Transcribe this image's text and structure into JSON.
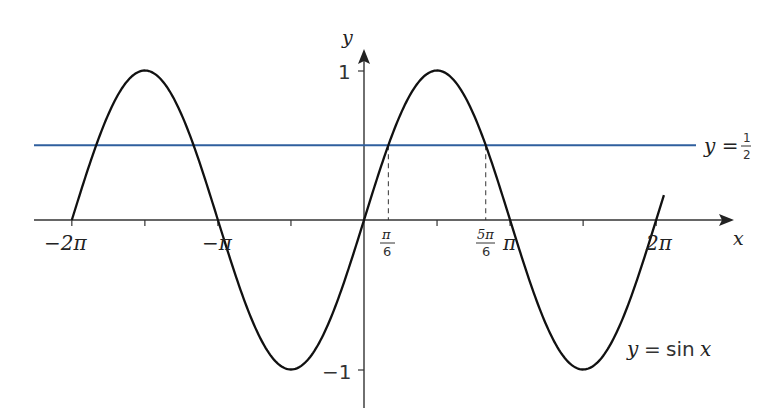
{
  "chart_data": {
    "type": "line",
    "title": "",
    "xlabel": "x",
    "ylabel": "y",
    "xlim": [
      -6.5,
      7.9
    ],
    "ylim": [
      -1.3,
      1.25
    ],
    "grid": false,
    "legend": "none",
    "series": [
      {
        "name": "y = sin x",
        "function": "sin(x)",
        "domain": [
          -6.2832,
          6.45
        ],
        "color": "#111111",
        "label_text": "y = sin x"
      },
      {
        "name": "y = 1/2",
        "function": "0.5",
        "domain": [
          -7.8,
          8.45
        ],
        "color": "#2f5f9e",
        "label_text": "y = 1/2"
      }
    ],
    "x_ticks": [
      {
        "value": -6.2832,
        "label": "−2π"
      },
      {
        "value": -4.7124,
        "label": ""
      },
      {
        "value": -3.1416,
        "label": "−π"
      },
      {
        "value": -1.5708,
        "label": ""
      },
      {
        "value": 0.5236,
        "label": "π/6"
      },
      {
        "value": 1.5708,
        "label": ""
      },
      {
        "value": 2.618,
        "label": "5π/6"
      },
      {
        "value": 3.1416,
        "label": "π"
      },
      {
        "value": 4.7124,
        "label": ""
      },
      {
        "value": 6.2832,
        "label": "2π"
      }
    ],
    "y_ticks": [
      {
        "value": 1,
        "label": "1"
      },
      {
        "value": -1,
        "label": "−1"
      }
    ],
    "annotations": [
      {
        "type": "dashed-vline",
        "x": 0.5236,
        "from_y": 0,
        "to_y": 0.5
      },
      {
        "type": "dashed-vline",
        "x": 2.618,
        "from_y": 0,
        "to_y": 0.5
      }
    ],
    "intersections": [
      {
        "x": -5.7596,
        "y": 0.5
      },
      {
        "x": -3.6652,
        "y": 0.5
      },
      {
        "x": 0.5236,
        "y": 0.5
      },
      {
        "x": 2.618,
        "y": 0.5
      }
    ]
  },
  "labels": {
    "x_axis": "x",
    "y_axis": "y",
    "y_one": "1",
    "y_minus_one": "−1",
    "neg_two_pi": "−2π",
    "neg_pi": "−π",
    "pi_over_6_num": "π",
    "pi_over_6_den": "6",
    "five_pi_over_6_num": "5π",
    "five_pi_over_6_den": "6",
    "pi": "π",
    "two_pi": "2π",
    "half_line_prefix": "y =",
    "half_num": "1",
    "half_den": "2",
    "sin_label_y": "y",
    "sin_label_eq": "=",
    "sin_label_fn": "sin",
    "sin_label_x": "x"
  }
}
